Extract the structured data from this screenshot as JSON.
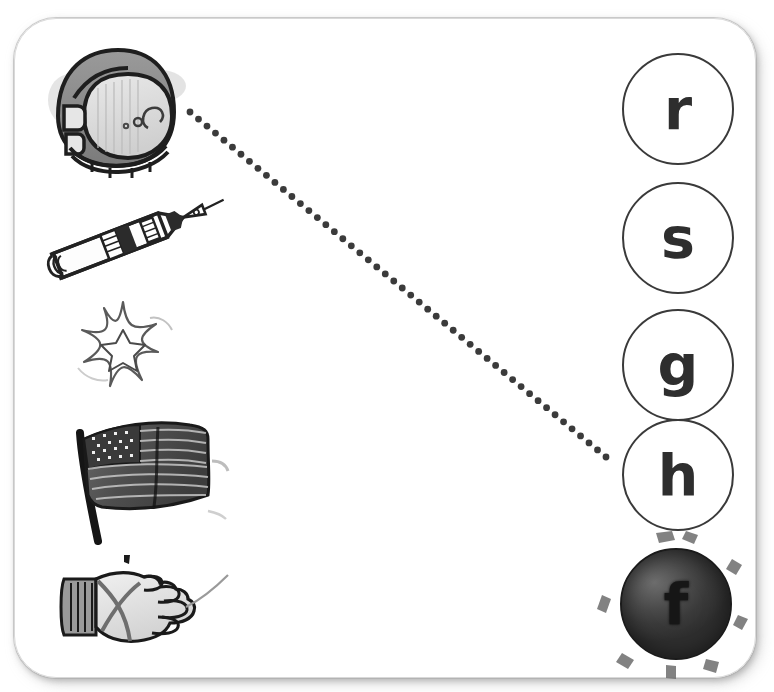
{
  "worksheet": {
    "title": "Space beginning-sound matching worksheet",
    "card_label": "worksheet-card"
  },
  "pictures": [
    {
      "id": "helmet",
      "name": "astronaut-helmet",
      "label": "astronaut helmet",
      "x": 40,
      "y": 42,
      "w": 150,
      "h": 140
    },
    {
      "id": "rocket",
      "name": "rocket",
      "label": "rocket",
      "x": 42,
      "y": 188,
      "w": 190,
      "h": 100
    },
    {
      "id": "star",
      "name": "star-sparkle",
      "label": "star",
      "x": 62,
      "y": 296,
      "w": 120,
      "h": 100
    },
    {
      "id": "flag",
      "name": "american-flag",
      "label": "flag",
      "x": 62,
      "y": 415,
      "w": 165,
      "h": 130
    },
    {
      "id": "glove",
      "name": "space-glove",
      "label": "glove",
      "x": 58,
      "y": 555,
      "w": 170,
      "h": 100
    }
  ],
  "letters": [
    {
      "id": "r",
      "letter": "r",
      "x": 622,
      "y": 53,
      "filled": false
    },
    {
      "id": "s",
      "letter": "s",
      "x": 622,
      "y": 182,
      "filled": false
    },
    {
      "id": "g",
      "letter": "g",
      "x": 622,
      "y": 309,
      "filled": false
    },
    {
      "id": "h",
      "letter": "h",
      "x": 622,
      "y": 419,
      "filled": false
    },
    {
      "id": "f",
      "letter": "f",
      "x": 620,
      "y": 548,
      "filled": true
    }
  ],
  "connection": {
    "name": "helmet-to-h-line",
    "from_picture": "helmet",
    "to_letter": "h",
    "x1": 190,
    "y1": 112,
    "x2": 606,
    "y2": 457,
    "style": "dotted",
    "color": "#3b3b3b",
    "dot_radius": 3.4,
    "dot_spacing": 11
  },
  "colors": {
    "ink": "#2e2e2e",
    "card_border": "#d9d9d9",
    "page_bg": "#ffffff",
    "dot": "#3b3b3b",
    "filled_circle": "#3a3a3a"
  }
}
